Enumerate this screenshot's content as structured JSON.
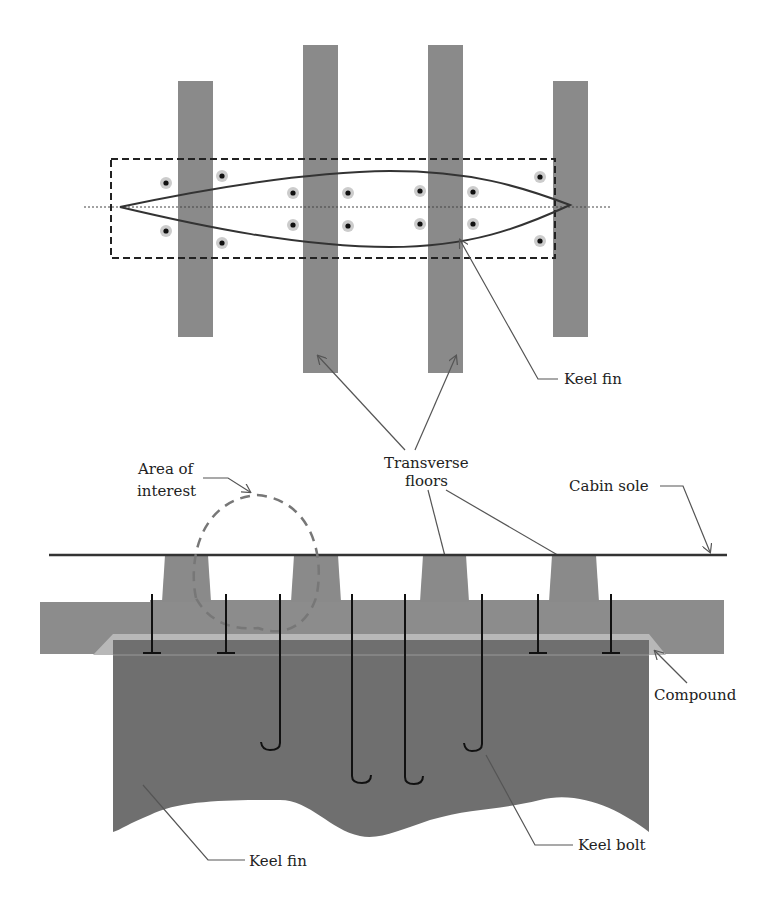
{
  "colors": {
    "floor": "#8a8a8a",
    "keel_fin": "#6f6f6f",
    "hull_base": "#8c8c8c",
    "compound": "#b8b8b8",
    "bolt": "#111111",
    "leader": "#555555",
    "outline": "#333333",
    "area_of_interest": "#777777"
  },
  "top_view": {
    "labels": {
      "keel_fin": "Keel fin"
    }
  },
  "section_view": {
    "labels": {
      "area_of_interest_line1": "Area of",
      "area_of_interest_line2": "interest",
      "transverse_line1": "Transverse",
      "transverse_line2": "floors",
      "cabin_sole": "Cabin sole",
      "compound": "Compound",
      "keel_fin": "Keel fin",
      "keel_bolt": "Keel bolt"
    }
  }
}
